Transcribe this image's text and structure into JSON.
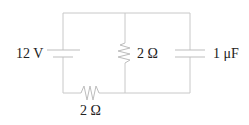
{
  "diagram": {
    "type": "circuit",
    "components": [
      {
        "id": "battery",
        "kind": "voltage-source",
        "label": "12 V"
      },
      {
        "id": "resistor-middle",
        "kind": "resistor",
        "label": "2 Ω"
      },
      {
        "id": "capacitor",
        "kind": "capacitor",
        "label": "1 μF"
      },
      {
        "id": "resistor-bottom",
        "kind": "resistor",
        "label": "2 Ω"
      }
    ],
    "colors": {
      "wire": "#c8c8c8",
      "text": "#222222",
      "background": "#ffffff"
    }
  }
}
